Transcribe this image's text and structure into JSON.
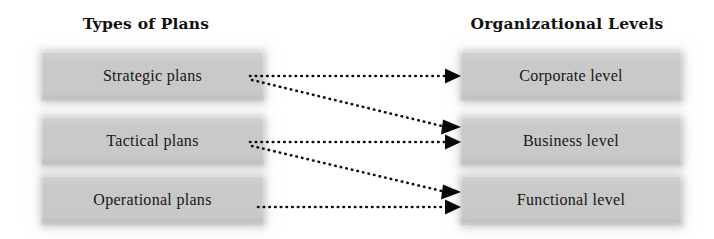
{
  "columns": {
    "left": {
      "title": "Types of Plans"
    },
    "right": {
      "title": "Organizational Levels"
    }
  },
  "nodes": {
    "plans": [
      {
        "id": "strategic",
        "label": "Strategic plans"
      },
      {
        "id": "tactical",
        "label": "Tactical plans"
      },
      {
        "id": "operational",
        "label": "Operational plans"
      }
    ],
    "levels": [
      {
        "id": "corporate",
        "label": "Corporate level"
      },
      {
        "id": "business",
        "label": "Business level"
      },
      {
        "id": "functional",
        "label": "Functional level"
      }
    ]
  },
  "connections": [
    {
      "from": "strategic",
      "to": "corporate",
      "style": "dotted",
      "arrow": "end"
    },
    {
      "from": "strategic",
      "to": "business",
      "style": "dotted",
      "arrow": "end"
    },
    {
      "from": "tactical",
      "to": "business",
      "style": "dotted",
      "arrow": "end"
    },
    {
      "from": "tactical",
      "to": "functional",
      "style": "dotted",
      "arrow": "end"
    },
    {
      "from": "operational",
      "to": "functional",
      "style": "dotted",
      "arrow": "end"
    }
  ],
  "colors": {
    "box_fill": "#c9c9c9",
    "text": "#171717",
    "connector": "#0d0d0d",
    "background": "#ffffff"
  }
}
